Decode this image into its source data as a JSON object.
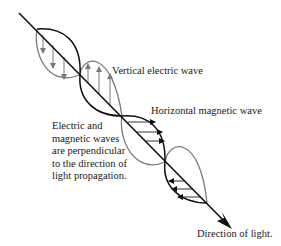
{
  "diagram": {
    "labels": {
      "electric_wave": "Vertical electric wave",
      "magnetic_wave": "Horizontal magnetic wave",
      "note": "Electric and\nmagnetic waves\nare perpendicular\nto the direction of\nlight propagation.",
      "direction": "Direction of light."
    },
    "colors": {
      "axis": "#111111",
      "electric_wave": "#7a7a7a",
      "magnetic_wave": "#111111",
      "background": "#ffffff"
    },
    "components": [
      {
        "name": "propagation-axis",
        "style": "straight arrow, top-left to bottom-right"
      },
      {
        "name": "electric-wave",
        "style": "gray sinusoidal lobes with vertical field arrows"
      },
      {
        "name": "magnetic-wave",
        "style": "black sinusoidal lobes with horizontal field arrows"
      }
    ]
  }
}
